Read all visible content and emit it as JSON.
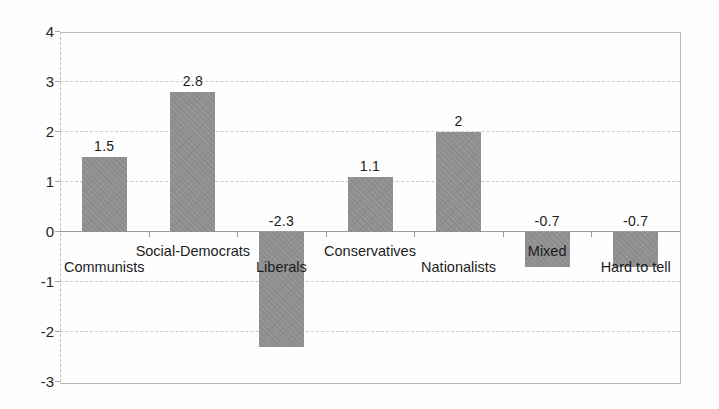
{
  "chart_data": {
    "type": "bar",
    "categories": [
      "Communists",
      "Social-Democrats",
      "Liberals",
      "Conservatives",
      "Nationalists",
      "Mixed",
      "Hard to tell"
    ],
    "values": [
      1.5,
      2.8,
      -2.3,
      1.1,
      2,
      -0.7,
      -0.7
    ],
    "value_labels": [
      "1.5",
      "2.8",
      "-2.3",
      "1.1",
      "2",
      "-0.7",
      "-0.7"
    ],
    "title": "",
    "xlabel": "",
    "ylabel": "",
    "ylim": [
      -3,
      4
    ],
    "yticks": [
      "4",
      "3",
      "2",
      "1",
      "0",
      "-1",
      "-2",
      "-3"
    ],
    "ytick_values": [
      4,
      3,
      2,
      1,
      0,
      -1,
      -2,
      -3
    ],
    "grid": true,
    "gridline_style": "dashed",
    "legend": false,
    "bar_color": "#8f8f8f",
    "gridline_color": "#cacaca",
    "axis_color": "#9a9a9a",
    "text_color": "#1c1c1c",
    "background_color": "#fefefe",
    "category_label_rows": [
      "lower",
      "upper",
      "lower",
      "upper",
      "lower",
      "upper",
      "lower"
    ]
  }
}
